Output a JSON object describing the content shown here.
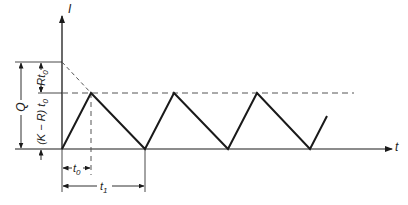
{
  "diagram": {
    "type": "sawtooth inventory/current vs time",
    "colors": {
      "line": "#1a1a1a",
      "dashed": "#555555",
      "background": "#ffffff"
    },
    "axes": {
      "y_label": "I",
      "x_label": "t"
    },
    "labels": {
      "Q": "Q",
      "R_t0": "Rt",
      "R_t0_sub": "0",
      "KR_t0": "(K − R) t",
      "KR_t0_sub": "0",
      "t0": "t",
      "t0_sub": "0",
      "t1": "t",
      "t1_sub": "1"
    },
    "waveform": {
      "points": [
        [
          62,
          149
        ],
        [
          91,
          93
        ],
        [
          145,
          149
        ],
        [
          174,
          93
        ],
        [
          228,
          149
        ],
        [
          257,
          93
        ],
        [
          310,
          149
        ],
        [
          327,
          116
        ]
      ]
    }
  }
}
